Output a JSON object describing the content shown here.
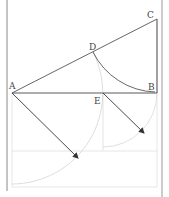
{
  "diagram": {
    "points": {
      "A": {
        "label": "A",
        "x": 12,
        "y": 93
      },
      "B": {
        "label": "B",
        "x": 157,
        "y": 93
      },
      "C": {
        "label": "C",
        "x": 157,
        "y": 19
      },
      "D": {
        "label": "D",
        "x": 93,
        "y": 52
      },
      "E": {
        "label": "E",
        "x": 103,
        "y": 93
      }
    },
    "labels": {
      "A": "A",
      "B": "B",
      "C": "C",
      "D": "D",
      "E": "E"
    },
    "colors": {
      "line": "#555555",
      "construction": "#d8d8d8",
      "border": "#888888",
      "arrow": "#333333"
    }
  }
}
